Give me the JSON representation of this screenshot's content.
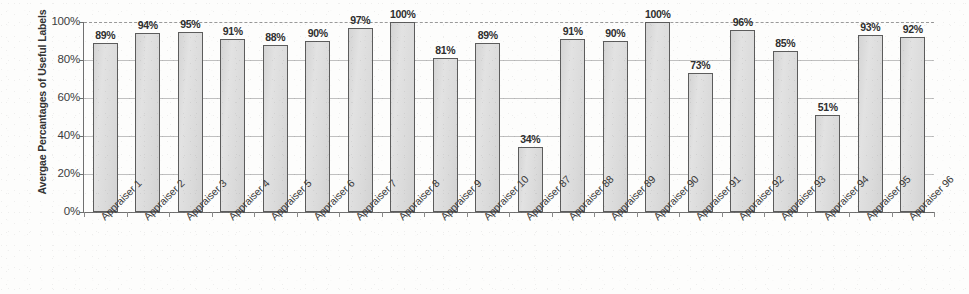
{
  "chart_data": {
    "type": "bar",
    "title": "",
    "subtitle": "",
    "xlabel": "",
    "ylabel": "Avergae Percantages of Useful Labels",
    "ylim": [
      0,
      100
    ],
    "ytick_labels": [
      "100%",
      "80%",
      "60%",
      "40%",
      "20%",
      "0%"
    ],
    "ytick_values": [
      100,
      80,
      60,
      40,
      20,
      0
    ],
    "grid": true,
    "grid_orientation": "horizontal",
    "legend": false,
    "legend_position": "none",
    "bar_value_suffix": "%",
    "categories": [
      "Appraiser 1",
      "Appraiser 2",
      "Appraiser 3",
      "Appraiser 4",
      "Appraiser 5",
      "Appraiser 6",
      "Appraiser 7",
      "Appraiser 8",
      "Appraiser 9",
      "Appraiser 10",
      "Appraiser 87",
      "Appraiser 88",
      "Appraiser 89",
      "Appraiser 90",
      "Appraiser 91",
      "Appraiser 92",
      "Appraiser 93",
      "Appraiser 94",
      "Appraiser 95",
      "Appraiser 96"
    ],
    "values": [
      89,
      94,
      95,
      91,
      88,
      90,
      97,
      100,
      81,
      89,
      34,
      91,
      90,
      100,
      73,
      96,
      85,
      51,
      93,
      92
    ],
    "data_labels": [
      "89%",
      "94%",
      "95%",
      "91%",
      "88%",
      "90%",
      "97%",
      "100%",
      "81%",
      "89%",
      "34%",
      "91%",
      "90%",
      "100%",
      "73%",
      "96%",
      "85%",
      "51%",
      "93%",
      "92%"
    ],
    "colors": {
      "bar_fill": "#dcdcdc",
      "bar_border": "#5c5c5c",
      "gridline": "#c0c0c0",
      "axis": "#707070",
      "text": "#333333",
      "background": "#fdfdfc"
    }
  }
}
